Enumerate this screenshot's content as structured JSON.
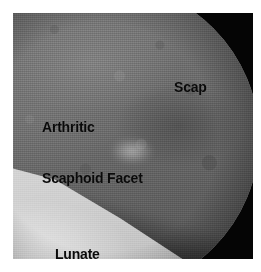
{
  "figure": {
    "kind": "wrist-arthroscopy-photograph",
    "modality": "arthroscopy",
    "width_px": 261,
    "height_px": 272,
    "background_color": "#ffffff",
    "photo": {
      "left_px": 13,
      "top_px": 13,
      "width_px": 240,
      "height_px": 246,
      "frame_color": "#000000",
      "field_of_view": "circular",
      "corners": "black vignetted"
    }
  },
  "annotations": [
    {
      "id": "scap",
      "lines": [
        "Scap"
      ],
      "color": "#0a0a0a",
      "position": {
        "left_px": 161,
        "top_px": 32
      },
      "points_to": "scaphoid"
    },
    {
      "id": "arthritic-scaphoid-facet",
      "lines": [
        "Arthritic",
        "Scaphoid Facet"
      ],
      "color": "#0a0a0a",
      "position": {
        "left_px": 29,
        "top_px": 72
      },
      "points_to": "arthritic scaphoid facet of distal radius"
    },
    {
      "id": "lunate-facet",
      "lines": [
        "Lunate",
        "Facet"
      ],
      "color": "#0a0a0a",
      "position": {
        "left_px": 42,
        "top_px": 199
      },
      "points_to": "lunate facet of distal radius"
    }
  ],
  "colors": {
    "page_background": "#ffffff",
    "photo_border": "#000000",
    "tissue_mid_grey": "#6e6e6e",
    "tissue_bright": "#d9d9d9",
    "annotation_text": "#0a0a0a"
  }
}
